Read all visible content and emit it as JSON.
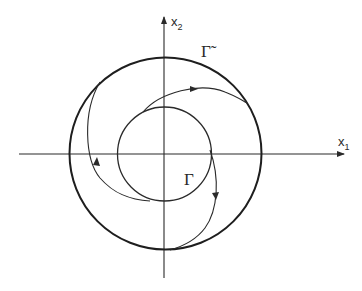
{
  "diagram": {
    "axes": {
      "x_label": "x",
      "x_sub": "1",
      "y_label": "x",
      "y_sub": "2"
    },
    "curves": {
      "outer_label": "Γ̃",
      "inner_label": "Γ"
    },
    "colors": {
      "stroke": "#2a2a2a",
      "background": "#ffffff"
    }
  }
}
